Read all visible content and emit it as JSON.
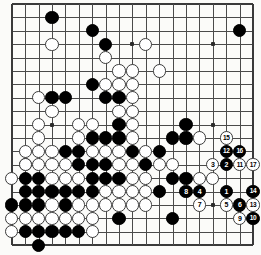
{
  "app": {
    "title": "Go Game Record Diagram",
    "board_size": 19,
    "colors": {
      "background": "#fbfbf9",
      "grid": "#4a4a4a",
      "edge": "#3a3a3a",
      "black_stone": "#000000",
      "white_stone": "#ffffff",
      "black_label": "#ffffff",
      "white_label": "#000000"
    }
  },
  "board": {
    "size": 19,
    "origin_x": 11.8,
    "origin_y": 4.0,
    "spacing": 13.4,
    "stone_radius": 6.6,
    "hoshi": [
      {
        "c": 3,
        "r": 3
      },
      {
        "c": 9,
        "r": 3
      },
      {
        "c": 15,
        "r": 3
      },
      {
        "c": 3,
        "r": 9
      },
      {
        "c": 9,
        "r": 9
      },
      {
        "c": 15,
        "r": 9
      },
      {
        "c": 3,
        "r": 15
      },
      {
        "c": 9,
        "r": 15
      },
      {
        "c": 15,
        "r": 15
      }
    ]
  },
  "chart_data": {
    "type": "table",
    "xlabel": "column (A-T)",
    "ylabel": "row (19-1)",
    "black_stones": [
      {
        "c": 3,
        "r": 1
      },
      {
        "c": 6,
        "r": 2
      },
      {
        "c": 17,
        "r": 2
      },
      {
        "c": 7,
        "r": 3
      },
      {
        "c": 6,
        "r": 6
      },
      {
        "c": 3,
        "r": 7
      },
      {
        "c": 4,
        "r": 7
      },
      {
        "c": 7,
        "r": 7
      },
      {
        "c": 8,
        "r": 7
      },
      {
        "c": 8,
        "r": 9
      },
      {
        "c": 6,
        "r": 10
      },
      {
        "c": 7,
        "r": 10
      },
      {
        "c": 8,
        "r": 10
      },
      {
        "c": 12,
        "r": 10
      },
      {
        "c": 4,
        "r": 11
      },
      {
        "c": 5,
        "r": 11
      },
      {
        "c": 9,
        "r": 11
      },
      {
        "c": 11,
        "r": 11
      },
      {
        "c": 13,
        "r": 9
      },
      {
        "c": 13,
        "r": 10
      },
      {
        "c": 5,
        "r": 12
      },
      {
        "c": 6,
        "r": 12
      },
      {
        "c": 7,
        "r": 12
      },
      {
        "c": 10,
        "r": 12
      },
      {
        "c": 1,
        "r": 13
      },
      {
        "c": 2,
        "r": 13
      },
      {
        "c": 6,
        "r": 13
      },
      {
        "c": 7,
        "r": 13
      },
      {
        "c": 8,
        "r": 13
      },
      {
        "c": 12,
        "r": 13
      },
      {
        "c": 13,
        "r": 13
      },
      {
        "c": 1,
        "r": 14
      },
      {
        "c": 2,
        "r": 14
      },
      {
        "c": 3,
        "r": 14
      },
      {
        "c": 4,
        "r": 14
      },
      {
        "c": 5,
        "r": 14
      },
      {
        "c": 6,
        "r": 14
      },
      {
        "c": 11,
        "r": 14
      },
      {
        "c": 0,
        "r": 15
      },
      {
        "c": 1,
        "r": 15
      },
      {
        "c": 2,
        "r": 15
      },
      {
        "c": 4,
        "r": 15
      },
      {
        "c": 1,
        "r": 17
      },
      {
        "c": 2,
        "r": 17
      },
      {
        "c": 3,
        "r": 17
      },
      {
        "c": 4,
        "r": 17
      },
      {
        "c": 5,
        "r": 17
      },
      {
        "c": 8,
        "r": 16
      },
      {
        "c": 12,
        "r": 16
      },
      {
        "c": 2,
        "r": 18
      }
    ],
    "white_stones": [
      {
        "c": 3,
        "r": 3
      },
      {
        "c": 10,
        "r": 3
      },
      {
        "c": 7,
        "r": 4
      },
      {
        "c": 8,
        "r": 5
      },
      {
        "c": 9,
        "r": 5
      },
      {
        "c": 11,
        "r": 5
      },
      {
        "c": 7,
        "r": 6
      },
      {
        "c": 8,
        "r": 6
      },
      {
        "c": 9,
        "r": 6
      },
      {
        "c": 2,
        "r": 7
      },
      {
        "c": 9,
        "r": 7
      },
      {
        "c": 3,
        "r": 8
      },
      {
        "c": 8,
        "r": 8
      },
      {
        "c": 9,
        "r": 8
      },
      {
        "c": 2,
        "r": 9
      },
      {
        "c": 5,
        "r": 9
      },
      {
        "c": 6,
        "r": 9
      },
      {
        "c": 9,
        "r": 9
      },
      {
        "c": 2,
        "r": 10
      },
      {
        "c": 5,
        "r": 10
      },
      {
        "c": 9,
        "r": 10
      },
      {
        "c": 14,
        "r": 10
      },
      {
        "c": 1,
        "r": 11
      },
      {
        "c": 2,
        "r": 11
      },
      {
        "c": 3,
        "r": 11
      },
      {
        "c": 6,
        "r": 11
      },
      {
        "c": 7,
        "r": 11
      },
      {
        "c": 8,
        "r": 11
      },
      {
        "c": 10,
        "r": 11
      },
      {
        "c": 1,
        "r": 12
      },
      {
        "c": 2,
        "r": 12
      },
      {
        "c": 3,
        "r": 12
      },
      {
        "c": 4,
        "r": 12
      },
      {
        "c": 8,
        "r": 12
      },
      {
        "c": 9,
        "r": 12
      },
      {
        "c": 11,
        "r": 12
      },
      {
        "c": 12,
        "r": 12
      },
      {
        "c": 0,
        "r": 13
      },
      {
        "c": 3,
        "r": 13
      },
      {
        "c": 4,
        "r": 13
      },
      {
        "c": 5,
        "r": 13
      },
      {
        "c": 9,
        "r": 13
      },
      {
        "c": 10,
        "r": 13
      },
      {
        "c": 14,
        "r": 13
      },
      {
        "c": 15,
        "r": 13
      },
      {
        "c": 3,
        "r": 14
      },
      {
        "c": 7,
        "r": 14
      },
      {
        "c": 8,
        "r": 14
      },
      {
        "c": 9,
        "r": 14
      },
      {
        "c": 10,
        "r": 14
      },
      {
        "c": 3,
        "r": 15
      },
      {
        "c": 5,
        "r": 15
      },
      {
        "c": 6,
        "r": 15
      },
      {
        "c": 7,
        "r": 15
      },
      {
        "c": 8,
        "r": 15
      },
      {
        "c": 9,
        "r": 15
      },
      {
        "c": 10,
        "r": 15
      },
      {
        "c": 0,
        "r": 16
      },
      {
        "c": 1,
        "r": 16
      },
      {
        "c": 2,
        "r": 16
      },
      {
        "c": 3,
        "r": 16
      },
      {
        "c": 4,
        "r": 16
      },
      {
        "c": 5,
        "r": 16
      },
      {
        "c": 6,
        "r": 16
      },
      {
        "c": 0,
        "r": 17
      },
      {
        "c": 6,
        "r": 17
      },
      {
        "c": 1,
        "r": 12
      }
    ],
    "numbered_moves": [
      {
        "n": 1,
        "color": "black",
        "c": 16,
        "r": 14
      },
      {
        "n": 2,
        "color": "black",
        "c": 16,
        "r": 12
      },
      {
        "n": 3,
        "color": "white",
        "c": 15,
        "r": 12
      },
      {
        "n": 4,
        "color": "black",
        "c": 14,
        "r": 14
      },
      {
        "n": 5,
        "color": "white",
        "c": 16,
        "r": 15
      },
      {
        "n": 6,
        "color": "black",
        "c": 17,
        "r": 15
      },
      {
        "n": 7,
        "color": "white",
        "c": 14,
        "r": 15
      },
      {
        "n": 8,
        "color": "black",
        "c": 13,
        "r": 14
      },
      {
        "n": 9,
        "color": "white",
        "c": 17,
        "r": 16
      },
      {
        "n": 10,
        "color": "black",
        "c": 18,
        "r": 16
      },
      {
        "n": 11,
        "color": "white",
        "c": 17,
        "r": 12
      },
      {
        "n": 12,
        "color": "black",
        "c": 16,
        "r": 11
      },
      {
        "n": 13,
        "color": "white",
        "c": 18,
        "r": 15
      },
      {
        "n": 14,
        "color": "black",
        "c": 18,
        "r": 14
      },
      {
        "n": 15,
        "color": "white",
        "c": 16,
        "r": 10
      },
      {
        "n": 16,
        "color": "black",
        "c": 17,
        "r": 11
      },
      {
        "n": 17,
        "color": "white",
        "c": 18,
        "r": 12
      }
    ]
  }
}
